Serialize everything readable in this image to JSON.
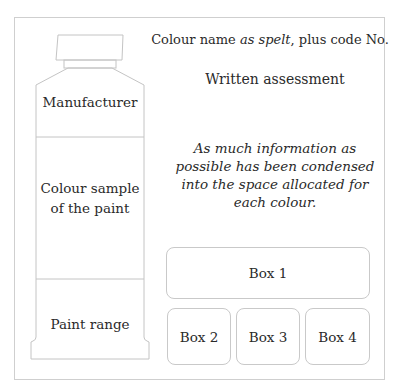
{
  "tube": {
    "sections": {
      "manufacturer": "Manufacturer",
      "colour_sample_line1": "Colour sample",
      "colour_sample_line2": "of the paint",
      "paint_range": "Paint range"
    }
  },
  "header": {
    "colour_name_prefix": "Colour name ",
    "colour_name_italic": "as spelt",
    "colour_name_suffix": ", plus code No."
  },
  "assessment": {
    "title": "Written assessment"
  },
  "note": {
    "lines": [
      "As much information as",
      "possible has been condensed",
      "into the space allocated for",
      "each colour."
    ]
  },
  "boxes": {
    "box1": "Box 1",
    "box2": "Box 2",
    "box3": "Box 3",
    "box4": "Box 4"
  },
  "colors": {
    "line": "#c9c9c9",
    "text": "#2a2a2a",
    "background": "#ffffff"
  }
}
